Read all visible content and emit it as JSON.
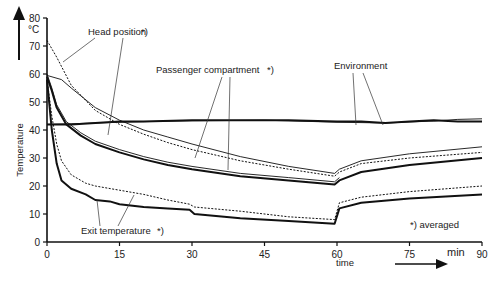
{
  "chart_data": {
    "type": "line",
    "title": "",
    "xlabel": "time",
    "xunit": "min",
    "ylabel": "Temperature",
    "yunit": "°C",
    "xlim": [
      0,
      90
    ],
    "ylim": [
      0,
      80
    ],
    "xticks": [
      0,
      15,
      30,
      45,
      60,
      75,
      90
    ],
    "yticks": [
      0,
      10,
      20,
      30,
      40,
      50,
      60,
      70,
      80
    ],
    "grid": false,
    "legend": "none (inline annotations)",
    "footnote": "*) averaged",
    "annotations": [
      {
        "text": "Head position",
        "marker": "*)"
      },
      {
        "text": "Passenger compartment",
        "marker": "*)"
      },
      {
        "text": "Environment",
        "marker": ""
      },
      {
        "text": "Exit temperature",
        "marker": "*)"
      }
    ],
    "series": [
      {
        "name": "Environment (solid)",
        "style": "thick",
        "x": [
          0,
          5,
          10,
          15,
          20,
          30,
          40,
          50,
          60,
          65,
          70,
          75,
          80,
          85,
          90
        ],
        "y": [
          42,
          42,
          42.5,
          43,
          43,
          43.5,
          43.5,
          43.5,
          43,
          43,
          42.5,
          43,
          43.5,
          43,
          43
        ]
      },
      {
        "name": "Environment (thin)",
        "style": "thin",
        "x": [
          0,
          5,
          10,
          20,
          30,
          45,
          60,
          70,
          80,
          85,
          90
        ],
        "y": [
          42,
          42.2,
          42.5,
          43,
          43.3,
          43.5,
          42.8,
          42.5,
          43.2,
          43.8,
          44
        ]
      },
      {
        "name": "Head position (dashed)",
        "style": "dashed",
        "x": [
          0,
          2,
          5,
          10,
          15,
          20,
          25,
          30,
          40,
          50,
          59.5,
          60.5,
          65,
          75,
          90
        ],
        "y": [
          72,
          66,
          56,
          47,
          42,
          38.5,
          35.5,
          33,
          29,
          26,
          23.5,
          25,
          28,
          30,
          32
        ]
      },
      {
        "name": "Head position (thin)",
        "style": "thin",
        "x": [
          0,
          3,
          5,
          10,
          15,
          20,
          25,
          30,
          40,
          50,
          59.5,
          60.5,
          65,
          75,
          90
        ],
        "y": [
          59.5,
          58,
          55,
          48,
          43.5,
          40,
          37.5,
          35,
          30.5,
          27,
          24.5,
          26,
          29,
          31.5,
          34
        ]
      },
      {
        "name": "Passenger compartment (thick)",
        "style": "thick",
        "x": [
          0,
          1,
          2,
          4,
          7,
          10,
          15,
          20,
          25,
          30,
          40,
          50,
          59.5,
          60.5,
          65,
          75,
          90
        ],
        "y": [
          59,
          54,
          48,
          42,
          38,
          35,
          32,
          29.5,
          27.5,
          26,
          23.5,
          22,
          20.5,
          22,
          25,
          27.5,
          30
        ]
      },
      {
        "name": "Passenger compartment (thin)",
        "style": "thin",
        "x": [
          0,
          1,
          2,
          4,
          7,
          10,
          15,
          20,
          25,
          30,
          40,
          50,
          59.5,
          60.5
        ],
        "y": [
          60,
          55,
          49,
          43,
          39,
          36,
          33,
          30.5,
          28.5,
          27,
          24.5,
          23,
          21.5,
          23
        ]
      },
      {
        "name": "Exit temperature (dotted)",
        "style": "dashed",
        "x": [
          0,
          1,
          2,
          3,
          5,
          8,
          10,
          15,
          20,
          25,
          29.5,
          30.5,
          40,
          50,
          59.5,
          60.5,
          65,
          75,
          90
        ],
        "y": [
          58,
          45,
          35,
          29,
          24,
          21,
          20,
          18.5,
          17,
          15,
          13.5,
          12.5,
          11,
          9,
          8,
          14,
          16,
          18,
          20
        ]
      },
      {
        "name": "Exit temperature (solid)",
        "style": "thick",
        "x": [
          0,
          1,
          2,
          3,
          5,
          8,
          10,
          13,
          15,
          20,
          25,
          29.5,
          30.5,
          40,
          50,
          59.5,
          60.5,
          65,
          75,
          90
        ],
        "y": [
          58,
          40,
          28,
          22,
          19,
          17,
          15,
          14.5,
          13.5,
          12.5,
          12,
          11.5,
          10,
          8.5,
          7.5,
          6.5,
          12,
          14,
          15.5,
          17
        ]
      }
    ]
  },
  "labels": {
    "y_unit": "°C",
    "y_title": "Temperature",
    "x_title": "time",
    "x_unit": "min",
    "head_position": "Head position",
    "head_marker": "*)",
    "passenger": "Passenger compartment",
    "passenger_marker": "*)",
    "environment": "Environment",
    "exit": "Exit temperature",
    "exit_marker": "*)",
    "footnote": "*) averaged"
  }
}
